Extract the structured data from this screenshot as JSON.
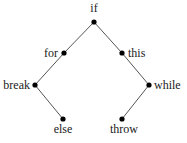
{
  "diagram": {
    "type": "binary-tree",
    "nodes": [
      {
        "id": "if",
        "label": "if",
        "x": 94,
        "y": 22,
        "label_x": 94,
        "label_y": 12,
        "anchor": "middle"
      },
      {
        "id": "for",
        "label": "for",
        "x": 64,
        "y": 53,
        "label_x": 58,
        "label_y": 57,
        "anchor": "end"
      },
      {
        "id": "this",
        "label": "this",
        "x": 122,
        "y": 53,
        "label_x": 128,
        "label_y": 57,
        "anchor": "start"
      },
      {
        "id": "break",
        "label": "break",
        "x": 35,
        "y": 85,
        "label_x": 30,
        "label_y": 89,
        "anchor": "end"
      },
      {
        "id": "while",
        "label": "while",
        "x": 149,
        "y": 85,
        "label_x": 154,
        "label_y": 89,
        "anchor": "start"
      },
      {
        "id": "else",
        "label": "else",
        "x": 63,
        "y": 119,
        "label_x": 63,
        "label_y": 133,
        "anchor": "middle"
      },
      {
        "id": "throw",
        "label": "throw",
        "x": 122,
        "y": 119,
        "label_x": 124,
        "label_y": 133,
        "anchor": "middle"
      }
    ],
    "edges": [
      {
        "from": "if",
        "to": "for"
      },
      {
        "from": "if",
        "to": "this"
      },
      {
        "from": "for",
        "to": "break"
      },
      {
        "from": "break",
        "to": "else"
      },
      {
        "from": "this",
        "to": "while"
      },
      {
        "from": "while",
        "to": "throw"
      }
    ],
    "colors": {
      "edge": "#555555",
      "node": "#000000",
      "text": "#1a1a1a",
      "background": "#ffffff"
    }
  }
}
